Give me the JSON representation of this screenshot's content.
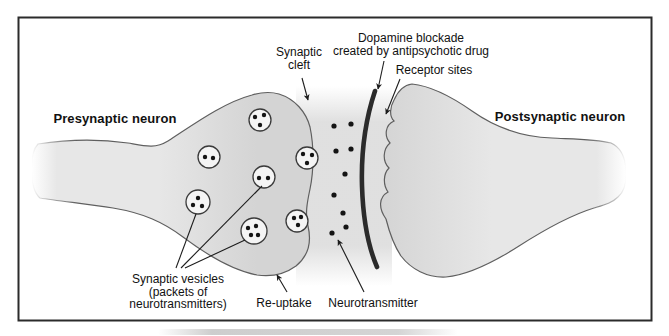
{
  "labels": {
    "presynaptic": "Presynaptic neuron",
    "postsynaptic": "Postsynaptic neuron",
    "synaptic_cleft": [
      "Synaptic",
      "cleft"
    ],
    "dopamine_blockade": [
      "Dopamine blockade",
      "created by antipsychotic drug"
    ],
    "receptor_sites": "Receptor sites",
    "synaptic_vesicles": [
      "Synaptic vesicles",
      "(packets of",
      "neurotransmitters)"
    ],
    "reuptake": "Re-uptake",
    "neurotransmitter": "Neurotransmitter"
  },
  "diagram": {
    "colors": {
      "border": "#2b2b2b",
      "background": "#ffffff",
      "neuron_fill": "#d4d4d4",
      "neuron_fill_light": "#e7e7e7",
      "neuron_outline": "#5f5f5f",
      "cleft_haze": "#d8d8d8",
      "blockade": "#2b2b2b",
      "vesicle_fill": "#f4f4f4",
      "vesicle_outline": "#3a3a3a",
      "dot": "#141414",
      "line": "#1c1c1c",
      "text": "#111111"
    },
    "vesicles": [
      {
        "x": 260,
        "y": 120,
        "r": 11,
        "dots": [
          [
            -5,
            -3
          ],
          [
            4,
            -5
          ],
          [
            0,
            5
          ]
        ]
      },
      {
        "x": 209,
        "y": 157,
        "r": 11,
        "dots": [
          [
            -4,
            0
          ],
          [
            4,
            1
          ]
        ]
      },
      {
        "x": 307,
        "y": 158,
        "r": 11,
        "dots": [
          [
            -4,
            -4
          ],
          [
            5,
            -3
          ],
          [
            0,
            5
          ]
        ]
      },
      {
        "x": 264,
        "y": 177,
        "r": 11,
        "dots": [
          [
            -5,
            1
          ],
          [
            4,
            1
          ]
        ]
      },
      {
        "x": 198,
        "y": 202,
        "r": 12,
        "dots": [
          [
            0,
            -4
          ],
          [
            -5,
            3
          ],
          [
            4,
            4
          ]
        ]
      },
      {
        "x": 297,
        "y": 221,
        "r": 11,
        "dots": [
          [
            -3,
            -3
          ],
          [
            4,
            -4
          ],
          [
            1,
            4
          ]
        ]
      },
      {
        "x": 254,
        "y": 231,
        "r": 13,
        "dots": [
          [
            -6,
            -3
          ],
          [
            2,
            -5
          ],
          [
            -3,
            4
          ],
          [
            4,
            4
          ]
        ]
      }
    ],
    "neurotransmitter_dots": [
      [
        334,
        126
      ],
      [
        351,
        124
      ],
      [
        336,
        151
      ],
      [
        351,
        149
      ],
      [
        345,
        174
      ],
      [
        334,
        195
      ],
      [
        343,
        213
      ],
      [
        346,
        227
      ],
      [
        332,
        233
      ]
    ],
    "leader_lines": [
      [
        176,
        268,
        196,
        214
      ],
      [
        181,
        268,
        262,
        186
      ],
      [
        185,
        268,
        245,
        240
      ]
    ],
    "arrows": [
      {
        "name": "synaptic-cleft-arrow",
        "from": [
          302,
          78
        ],
        "to": [
          308,
          100
        ]
      },
      {
        "name": "dopamine-blockade-arrow",
        "from": [
          384,
          61
        ],
        "to": [
          378,
          89
        ]
      },
      {
        "name": "receptor-sites-arrow",
        "from": [
          400,
          79
        ],
        "to": [
          386,
          114
        ]
      },
      {
        "name": "reuptake-arrow",
        "from": [
          287,
          292
        ],
        "to": [
          277,
          275
        ]
      },
      {
        "name": "neurotransmitter-arrow",
        "from": [
          364,
          292
        ],
        "to": [
          338,
          240
        ]
      }
    ]
  }
}
